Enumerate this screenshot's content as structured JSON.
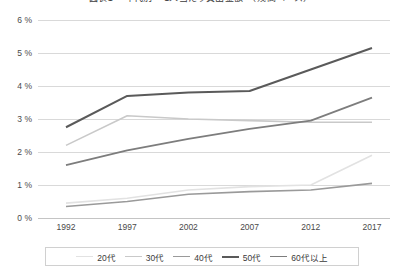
{
  "chart_data": {
    "type": "line",
    "title": "図表1 　年代別 　1人当たり貸出金額　（残高ベース）",
    "xlabel": "",
    "ylabel": "",
    "categories": [
      "1992",
      "1997",
      "2002",
      "2007",
      "2012",
      "2017"
    ],
    "x": [
      1992,
      1997,
      2002,
      2007,
      2012,
      2017
    ],
    "ylim": [
      0,
      6
    ],
    "ytick_labels": [
      "0 %",
      "1 %",
      "2 %",
      "3 %",
      "4 %",
      "5 %",
      "6 %"
    ],
    "ytick_values": [
      0,
      1,
      2,
      3,
      4,
      5,
      6
    ],
    "grid": true,
    "legend_position": "bottom",
    "series": [
      {
        "name": "20代",
        "color": "#e2e2e2",
        "width": 1.6,
        "values": [
          0.45,
          0.6,
          0.85,
          0.95,
          1.0,
          1.9
        ]
      },
      {
        "name": "30代",
        "color": "#c9c9c9",
        "width": 1.6,
        "values": [
          2.2,
          3.1,
          3.0,
          2.95,
          2.9,
          2.9
        ]
      },
      {
        "name": "40代",
        "color": "#9a9a9a",
        "width": 1.6,
        "values": [
          0.35,
          0.5,
          0.72,
          0.8,
          0.85,
          1.05
        ]
      },
      {
        "name": "50代",
        "color": "#5a5a5a",
        "width": 2.0,
        "values": [
          2.75,
          3.7,
          3.8,
          3.85,
          4.5,
          5.15
        ]
      },
      {
        "name": "60代以上",
        "color": "#7d7d7d",
        "width": 1.8,
        "values": [
          1.6,
          2.05,
          2.4,
          2.7,
          2.95,
          3.65
        ]
      }
    ]
  }
}
